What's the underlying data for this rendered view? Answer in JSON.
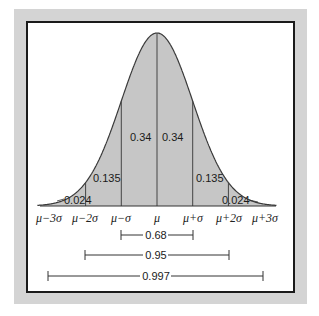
{
  "chart_data": {
    "type": "area",
    "title": "",
    "xlabel": "",
    "ylabel": "",
    "curve": {
      "mean_px": 157,
      "sigma_px": 35.7,
      "baseline_px": 206,
      "peak_px": 33
    },
    "categories": [
      "μ−3σ",
      "μ−2σ",
      "μ−σ",
      "μ",
      "μ+σ",
      "μ+2σ",
      "μ+3σ"
    ],
    "segments": [
      {
        "from": "μ−3σ",
        "to": "μ−2σ",
        "area": 0.024
      },
      {
        "from": "μ−2σ",
        "to": "μ−σ",
        "area": 0.135
      },
      {
        "from": "μ−σ",
        "to": "μ",
        "area": 0.34
      },
      {
        "from": "μ",
        "to": "μ+σ",
        "area": 0.34
      },
      {
        "from": "μ+σ",
        "to": "μ+2σ",
        "area": 0.135
      },
      {
        "from": "μ+2σ",
        "to": "μ+3σ",
        "area": 0.024
      }
    ],
    "intervals": [
      {
        "range": "μ±σ",
        "value": 0.68
      },
      {
        "range": "μ±2σ",
        "value": 0.95
      },
      {
        "range": "μ±3σ",
        "value": 0.997
      }
    ],
    "grid": false,
    "legend": "none"
  },
  "labels": {
    "seg_l3": "0.024",
    "seg_l2": "0.135",
    "seg_l1": "0.34",
    "seg_r1": "0.34",
    "seg_r2": "0.135",
    "seg_r3": "0.024",
    "tick_m3": "μ−3σ",
    "tick_m2": "μ−2σ",
    "tick_m1": "μ−σ",
    "tick_0": "μ",
    "tick_p1": "μ+σ",
    "tick_p2": "μ+2σ",
    "tick_p3": "μ+3σ",
    "int_1": "0.68",
    "int_2": "0.95",
    "int_3": "0.997"
  },
  "colors": {
    "fill": "#c6c6c6",
    "line": "#3a3a3a",
    "frame": "#d4d4d4"
  }
}
